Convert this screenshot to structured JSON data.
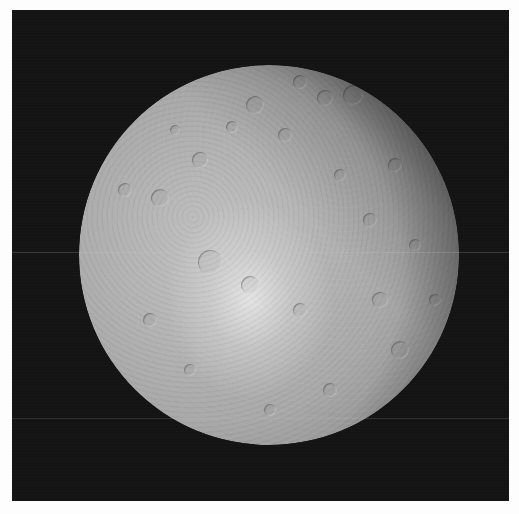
{
  "image": {
    "subject": "cratered icy moon",
    "description": "Grayscale spacecraft photograph of a heavily cratered moon, nearly full phase, with a bright ray-crater splash just below center and a soft terminator shading toward the upper-right limb, set against black space inside a thin white page margin.",
    "width": 519,
    "height": 514
  },
  "frame": {
    "x": 12,
    "y": 10,
    "width": 497,
    "height": 491,
    "background": "#141414",
    "page_margin_color": "#fdfdfd"
  },
  "moon": {
    "cx": 269,
    "cy": 255,
    "radius": 190,
    "base_color": "#a9a9a9",
    "highlight_color": "#e4e4e4",
    "limb_shadow_color": "#2a2a2a",
    "bright_spot": {
      "cx": 250,
      "cy": 300,
      "radius": 70
    },
    "craters": [
      {
        "x": 255,
        "y": 105,
        "r": 9
      },
      {
        "x": 300,
        "y": 82,
        "r": 7
      },
      {
        "x": 325,
        "y": 98,
        "r": 8
      },
      {
        "x": 353,
        "y": 95,
        "r": 10
      },
      {
        "x": 232,
        "y": 127,
        "r": 6
      },
      {
        "x": 285,
        "y": 135,
        "r": 7
      },
      {
        "x": 200,
        "y": 160,
        "r": 8
      },
      {
        "x": 340,
        "y": 175,
        "r": 6
      },
      {
        "x": 395,
        "y": 165,
        "r": 7
      },
      {
        "x": 160,
        "y": 198,
        "r": 9
      },
      {
        "x": 125,
        "y": 190,
        "r": 7
      },
      {
        "x": 210,
        "y": 262,
        "r": 12
      },
      {
        "x": 250,
        "y": 285,
        "r": 9
      },
      {
        "x": 300,
        "y": 310,
        "r": 7
      },
      {
        "x": 380,
        "y": 300,
        "r": 8
      },
      {
        "x": 415,
        "y": 245,
        "r": 6
      },
      {
        "x": 400,
        "y": 350,
        "r": 9
      },
      {
        "x": 150,
        "y": 320,
        "r": 7
      },
      {
        "x": 190,
        "y": 370,
        "r": 6
      },
      {
        "x": 330,
        "y": 390,
        "r": 7
      },
      {
        "x": 270,
        "y": 410,
        "r": 6
      },
      {
        "x": 435,
        "y": 300,
        "r": 6
      },
      {
        "x": 370,
        "y": 220,
        "r": 7
      },
      {
        "x": 175,
        "y": 130,
        "r": 5
      }
    ]
  },
  "streaks": [
    {
      "y": 252,
      "color": "rgba(200,200,200,0.22)"
    },
    {
      "y": 418,
      "color": "rgba(200,200,200,0.16)"
    }
  ],
  "text": []
}
